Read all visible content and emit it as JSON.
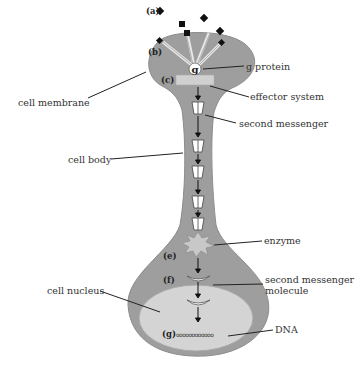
{
  "diagram": {
    "type": "biology-signal-transduction",
    "colors": {
      "cell_fill": "#9e9e9e",
      "cell_stroke": "#8a8a8a",
      "nucleus_fill": "#d4d4d4",
      "effector_fill": "#cfcfcf",
      "enzyme_fill": "#c8c8c8",
      "line": "#222222",
      "text": "#333333"
    },
    "step_markers": {
      "a": "(a)",
      "b": "(b)",
      "c": "(c)",
      "e": "(e)",
      "f": "(f)",
      "g": "(g)"
    },
    "g_protein_glyph": "g",
    "dna_glyph": "oooooooooooo",
    "labels": {
      "g_protein": "g protein",
      "effector_system": "effector system",
      "second_messenger": "second messenger",
      "enzyme": "enzyme",
      "second_messenger_molecule_line1": "second messenger",
      "second_messenger_molecule_line2": "molecule",
      "dna": "DNA",
      "cell_membrane": "cell membrane",
      "cell_body": "cell body",
      "cell_nucleus": "cell nucleus"
    }
  }
}
